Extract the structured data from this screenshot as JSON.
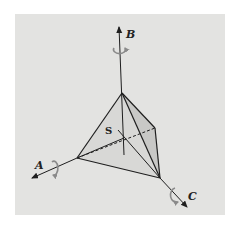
{
  "figure": {
    "colors": {
      "background": "#e3e3e1",
      "face_light": "#d6d6d4",
      "face_dark": "#c6c6c4",
      "edge": "#1e1e1e",
      "rotation_arrow": "#8a8a8a"
    },
    "labels": {
      "axis_a": "A",
      "axis_b": "B",
      "axis_c": "C",
      "center": "S"
    }
  }
}
